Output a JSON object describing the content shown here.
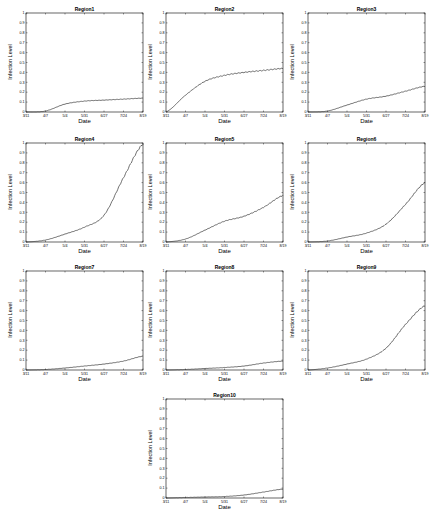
{
  "figure": {
    "xlabel": "Date",
    "ylabel": "Infection Level",
    "x_ticks": [
      "3/11",
      "4/7",
      "5/4",
      "5/31",
      "6/27",
      "7/24",
      "8/19"
    ],
    "y_ticks": [
      "0",
      "0.1",
      "0.2",
      "0.3",
      "0.4",
      "0.5",
      "0.6",
      "0.7",
      "0.8",
      "0.9",
      "1"
    ],
    "line_color": "#333333"
  },
  "chart_data": [
    {
      "type": "line",
      "title": "Region1",
      "xlabel": "Date",
      "ylabel": "Infection Level",
      "ylim": [
        0,
        1
      ],
      "categories": [
        "3/11",
        "4/7",
        "5/4",
        "5/31",
        "6/27",
        "7/24",
        "8/19"
      ],
      "values": [
        0.0,
        0.01,
        0.08,
        0.11,
        0.12,
        0.13,
        0.14
      ]
    },
    {
      "type": "line",
      "title": "Region2",
      "xlabel": "Date",
      "ylabel": "Infection Level",
      "ylim": [
        0,
        1
      ],
      "categories": [
        "3/11",
        "4/7",
        "5/4",
        "5/31",
        "6/27",
        "7/24",
        "8/19"
      ],
      "values": [
        0.0,
        0.17,
        0.31,
        0.37,
        0.4,
        0.42,
        0.44
      ]
    },
    {
      "type": "line",
      "title": "Region3",
      "xlabel": "Date",
      "ylabel": "Infection Level",
      "ylim": [
        0,
        1
      ],
      "categories": [
        "3/11",
        "4/7",
        "5/4",
        "5/31",
        "6/27",
        "7/24",
        "8/19"
      ],
      "values": [
        0.0,
        0.01,
        0.07,
        0.13,
        0.16,
        0.21,
        0.26
      ]
    },
    {
      "type": "line",
      "title": "Region4",
      "xlabel": "Date",
      "ylabel": "Infection Level",
      "ylim": [
        0,
        1
      ],
      "categories": [
        "3/11",
        "4/7",
        "5/4",
        "5/31",
        "6/27",
        "7/24",
        "8/19"
      ],
      "values": [
        0.0,
        0.02,
        0.08,
        0.15,
        0.27,
        0.65,
        0.99
      ]
    },
    {
      "type": "line",
      "title": "Region5",
      "xlabel": "Date",
      "ylabel": "Infection Level",
      "ylim": [
        0,
        1
      ],
      "categories": [
        "3/11",
        "4/7",
        "5/4",
        "5/31",
        "6/27",
        "7/24",
        "8/19"
      ],
      "values": [
        0.0,
        0.03,
        0.12,
        0.21,
        0.26,
        0.35,
        0.47
      ]
    },
    {
      "type": "line",
      "title": "Region6",
      "xlabel": "Date",
      "ylabel": "Infection Level",
      "ylim": [
        0,
        1
      ],
      "categories": [
        "3/11",
        "4/7",
        "5/4",
        "5/31",
        "6/27",
        "7/24",
        "8/19"
      ],
      "values": [
        0.0,
        0.01,
        0.05,
        0.09,
        0.18,
        0.38,
        0.6
      ]
    },
    {
      "type": "line",
      "title": "Region7",
      "xlabel": "Date",
      "ylabel": "Infection Level",
      "ylim": [
        0,
        1
      ],
      "categories": [
        "3/11",
        "4/7",
        "5/4",
        "5/31",
        "6/27",
        "7/24",
        "8/19"
      ],
      "values": [
        0.0,
        0.005,
        0.02,
        0.04,
        0.06,
        0.09,
        0.14
      ]
    },
    {
      "type": "line",
      "title": "Region8",
      "xlabel": "Date",
      "ylabel": "Infection Level",
      "ylim": [
        0,
        1
      ],
      "categories": [
        "3/11",
        "4/7",
        "5/4",
        "5/31",
        "6/27",
        "7/24",
        "8/19"
      ],
      "values": [
        0.0,
        0.005,
        0.015,
        0.025,
        0.04,
        0.07,
        0.09
      ]
    },
    {
      "type": "line",
      "title": "Region9",
      "xlabel": "Date",
      "ylabel": "Infection Level",
      "ylim": [
        0,
        1
      ],
      "categories": [
        "3/11",
        "4/7",
        "5/4",
        "5/31",
        "6/27",
        "7/24",
        "8/19"
      ],
      "values": [
        0.0,
        0.02,
        0.06,
        0.11,
        0.22,
        0.46,
        0.65
      ]
    },
    {
      "type": "line",
      "title": "Region10",
      "xlabel": "Date",
      "ylabel": "Infection Level",
      "ylim": [
        0,
        1
      ],
      "categories": [
        "3/11",
        "4/7",
        "5/4",
        "5/31",
        "6/27",
        "7/24",
        "8/19"
      ],
      "values": [
        0.0,
        0.005,
        0.01,
        0.015,
        0.03,
        0.06,
        0.09
      ]
    }
  ]
}
